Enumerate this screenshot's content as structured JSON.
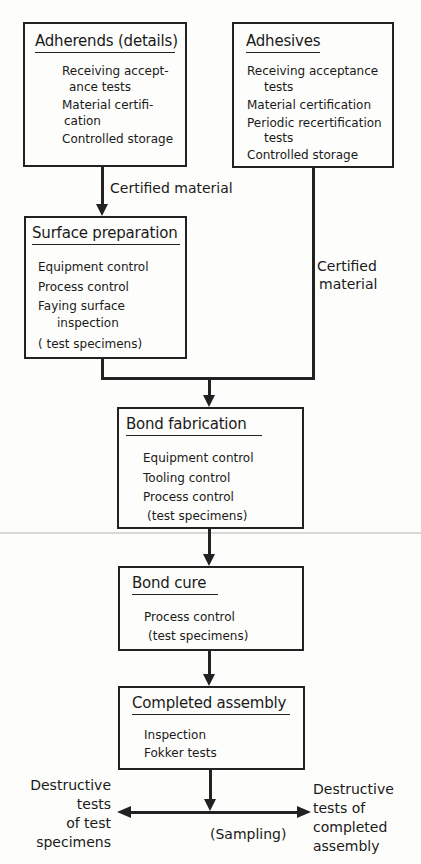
{
  "boxes": {
    "adherends": {
      "title": "Adherends (details)",
      "lines": [
        "Receiving accept-",
        "ance tests",
        "Material certifi-",
        "cation",
        "Controlled storage"
      ]
    },
    "adhesives": {
      "title": "Adhesives",
      "lines": [
        "Receiving acceptance",
        "tests",
        "Material certification",
        "Periodic recertification",
        "tests",
        "Controlled storage"
      ]
    },
    "surface_preparation": {
      "title": "Surface preparation",
      "lines": [
        "Equipment control",
        "Process control",
        "Faying surface",
        "inspection",
        "( test specimens)"
      ]
    },
    "bond_fabrication": {
      "title": "Bond fabrication",
      "lines": [
        "Equipment control",
        "Tooling control",
        "Process control",
        "(test specimens)"
      ]
    },
    "bond_cure": {
      "title": "Bond cure",
      "lines": [
        "Process control",
        "(test specimens)"
      ]
    },
    "completed_assembly": {
      "title": "Completed assembly",
      "lines": [
        "Inspection",
        "Fokker tests"
      ]
    }
  },
  "connectors": {
    "adherends_to_surface": "Certified material",
    "adhesives_to_bond": [
      "Certified",
      "material"
    ],
    "left_outcome": [
      "Destructive",
      "tests",
      "of test",
      "specimens"
    ],
    "right_outcome": [
      "Destructive",
      "tests of",
      "completed",
      "assembly"
    ],
    "sampling": "(Sampling)"
  }
}
